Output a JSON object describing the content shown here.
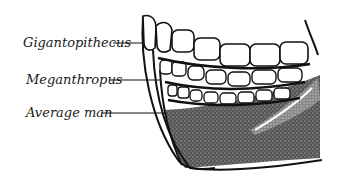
{
  "figure": {
    "labels": [
      {
        "text": "Gigantopithecus"
      },
      {
        "text": "Meganthropus"
      },
      {
        "text": "Average man"
      }
    ]
  }
}
